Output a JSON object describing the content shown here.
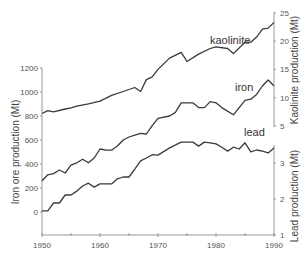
{
  "chart_data": {
    "type": "line",
    "title": "",
    "xlabel": "",
    "x_range": [
      1950,
      1990
    ],
    "x_ticks": [
      1950,
      1960,
      1970,
      1980,
      1990
    ],
    "x_minor_ticks": [
      1955,
      1965,
      1975,
      1985
    ],
    "grid": false,
    "legend": "inline labels",
    "axes": {
      "left": {
        "label": "Iron ore production (Mt)",
        "ticks": [
          0,
          200,
          400,
          600,
          800,
          1000,
          1200
        ],
        "range": [
          -200,
          1200
        ]
      },
      "right_top": {
        "label": "Kaolinite production (Mt)",
        "ticks": [
          5,
          10,
          15,
          20,
          25
        ],
        "range": [
          5,
          25
        ]
      },
      "right_bottom": {
        "label": "Lead production (Mt)",
        "ticks": [
          1,
          2,
          3
        ],
        "range": [
          1,
          3.5
        ]
      }
    },
    "series": [
      {
        "name": "kaolinite",
        "axis": "right_top",
        "x": [
          1950,
          1951,
          1952,
          1954,
          1955,
          1956,
          1958,
          1960,
          1962,
          1964,
          1966,
          1967,
          1968,
          1969,
          1970,
          1972,
          1974,
          1975,
          1977,
          1979,
          1980,
          1982,
          1983,
          1985,
          1986,
          1987,
          1988,
          1989,
          1990
        ],
        "values": [
          7.2,
          7.7,
          7.5,
          8.0,
          8.2,
          8.5,
          8.9,
          9.4,
          10.4,
          11.1,
          11.8,
          11.1,
          13.2,
          13.7,
          15.0,
          17.0,
          18.0,
          16.4,
          17.7,
          18.7,
          19.0,
          18.7,
          17.8,
          19.8,
          19.8,
          20.7,
          22.1,
          22.3,
          23.3
        ]
      },
      {
        "name": "iron",
        "axis": "left",
        "x": [
          1950,
          1951,
          1952,
          1953,
          1954,
          1955,
          1956,
          1957,
          1958,
          1959,
          1960,
          1961,
          1962,
          1963,
          1964,
          1965,
          1966,
          1967,
          1968,
          1969,
          1970,
          1972,
          1973,
          1974,
          1975,
          1976,
          1977,
          1978,
          1979,
          1980,
          1981,
          1983,
          1985,
          1986,
          1987,
          1988,
          1989,
          1990
        ],
        "values": [
          260,
          310,
          320,
          350,
          325,
          390,
          410,
          440,
          410,
          450,
          525,
          515,
          515,
          550,
          600,
          625,
          640,
          655,
          650,
          720,
          780,
          800,
          830,
          910,
          910,
          910,
          870,
          870,
          920,
          910,
          870,
          810,
          930,
          940,
          980,
          1050,
          1100,
          1050
        ]
      },
      {
        "name": "lead",
        "axis": "right_bottom",
        "x": [
          1950,
          1951,
          1952,
          1953,
          1954,
          1955,
          1956,
          1957,
          1958,
          1959,
          1960,
          1961,
          1962,
          1963,
          1964,
          1965,
          1966,
          1967,
          1968,
          1969,
          1970,
          1972,
          1974,
          1975,
          1976,
          1977,
          1978,
          1979,
          1980,
          1981,
          1982,
          1983,
          1984,
          1985,
          1986,
          1987,
          1988,
          1989,
          1990
        ],
        "values": [
          1.67,
          1.67,
          1.89,
          1.89,
          2.11,
          2.11,
          2.22,
          2.36,
          2.44,
          2.33,
          2.42,
          2.42,
          2.42,
          2.56,
          2.61,
          2.61,
          2.83,
          3.06,
          3.14,
          3.23,
          3.22,
          3.42,
          3.58,
          3.58,
          3.58,
          3.47,
          3.58,
          3.56,
          3.53,
          3.44,
          3.33,
          3.44,
          3.39,
          3.56,
          3.31,
          3.36,
          3.33,
          3.28,
          3.42
        ]
      }
    ]
  },
  "labels": {
    "kaolinite": "kaolinite",
    "iron": "iron",
    "lead": "lead"
  }
}
